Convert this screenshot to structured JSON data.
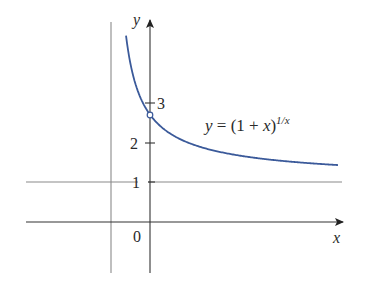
{
  "chart_data": {
    "type": "line",
    "title": "",
    "xlabel": "x",
    "ylabel": "y",
    "equation_label": "y = (1 + x)^(1/x)",
    "equation_parts": {
      "lhs": "y = (1 + ",
      "var": "x",
      "rparen": ")",
      "exponent": "1/x"
    },
    "series": [
      {
        "name": "y = (1 + x)^(1/x)",
        "color": "#3b5a9a",
        "x": [
          -0.615,
          -0.5,
          -0.4,
          -0.3,
          -0.2,
          -0.1,
          0.0,
          0.25,
          0.5,
          1.0,
          1.5,
          2.0,
          3.0,
          4.0,
          4.82
        ],
        "y": [
          4.72,
          4.0,
          3.42,
          3.28,
          3.05,
          2.87,
          2.718,
          2.44,
          2.25,
          2.0,
          1.84,
          1.73,
          1.59,
          1.5,
          1.44
        ]
      }
    ],
    "open_point": {
      "x": 0,
      "y": 2.718,
      "label": "hole at (0, e)"
    },
    "asymptotes": [
      {
        "type": "vertical",
        "x": -1
      },
      {
        "type": "horizontal",
        "y": 1
      }
    ],
    "y_ticks": [
      {
        "value": 1,
        "label": "1"
      },
      {
        "value": 2,
        "label": "2"
      },
      {
        "value": 3,
        "label": "3"
      }
    ],
    "x_ticks": [
      {
        "value": 0,
        "label": "0"
      }
    ],
    "xlim": [
      -3.2,
      4.95
    ],
    "ylim": [
      -1.3,
      5.1
    ],
    "grid": false,
    "legend": "none"
  },
  "colors": {
    "curve": "#3b5a9a",
    "axis": "#333333",
    "asymptote": "#8a8a8a",
    "text": "#2a2a2a"
  }
}
